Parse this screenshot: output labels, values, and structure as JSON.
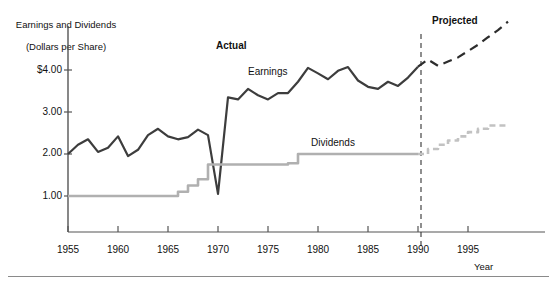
{
  "chart_data": {
    "type": "line",
    "title": "",
    "ylabel": "Earnings and Dividends\n(Dollars per Share)",
    "ylabel_line1": "Earnings and Dividends",
    "ylabel_line2": "(Dollars per Share)",
    "xlabel": "Year",
    "grid": false,
    "legend_position": "inline-annotations",
    "xlim": [
      1955,
      1999
    ],
    "ylim": [
      0.0,
      5.4
    ],
    "yticks": [
      1.0,
      2.0,
      3.0,
      4.0
    ],
    "ytick_labels": [
      "1.00",
      "2.00",
      "3.00",
      "$4.00"
    ],
    "xticks": [
      1955,
      1960,
      1965,
      1970,
      1975,
      1980,
      1985,
      1990,
      1995
    ],
    "xtick_labels": [
      "1955",
      "1960",
      "1965",
      "1970",
      "1975",
      "1980",
      "1985",
      "1990",
      "1995"
    ],
    "annotations": [
      {
        "text": "Actual",
        "x": 1973,
        "y": 4.75,
        "bold": true
      },
      {
        "text": "Projected",
        "x": 1992,
        "y": 5.25,
        "bold": true
      },
      {
        "text": "Earnings",
        "x": 1980,
        "y": 4.18,
        "bold": false
      },
      {
        "text": "Dividends",
        "x": 1986,
        "y": 2.45,
        "bold": false
      }
    ],
    "divider": {
      "x": 1990.3,
      "style": "dashed",
      "label": "actual-projected-divider"
    },
    "series": [
      {
        "name": "Earnings",
        "color": "#3d3d3d",
        "style": "solid",
        "segment": "actual",
        "x": [
          1955,
          1956,
          1957,
          1958,
          1959,
          1960,
          1961,
          1962,
          1963,
          1964,
          1965,
          1966,
          1967,
          1968,
          1969,
          1970,
          1971,
          1972,
          1973,
          1974,
          1975,
          1976,
          1977,
          1978,
          1979,
          1980,
          1981,
          1982,
          1983,
          1984,
          1985,
          1986,
          1987,
          1988,
          1989,
          1990
        ],
        "values": [
          2.0,
          2.22,
          2.35,
          2.05,
          2.15,
          2.42,
          1.95,
          2.1,
          2.45,
          2.6,
          2.42,
          2.35,
          2.4,
          2.58,
          2.45,
          1.05,
          3.35,
          3.3,
          3.55,
          3.4,
          3.3,
          3.45,
          3.45,
          3.72,
          4.05,
          3.92,
          3.78,
          3.98,
          4.07,
          3.75,
          3.6,
          3.55,
          3.72,
          3.62,
          3.82,
          4.08
        ]
      },
      {
        "name": "Earnings (projected)",
        "color": "#2d2d2d",
        "style": "dashed",
        "segment": "projected",
        "x": [
          1990,
          1991,
          1992,
          1993,
          1994,
          1995,
          1996,
          1997,
          1998,
          1999
        ],
        "values": [
          4.08,
          4.25,
          4.1,
          4.2,
          4.3,
          4.45,
          4.6,
          4.78,
          4.95,
          5.15
        ]
      },
      {
        "name": "Dividends",
        "color": "#b0b0b0",
        "style": "solid-step",
        "segment": "actual",
        "x": [
          1955,
          1966,
          1966,
          1967,
          1967,
          1968,
          1968,
          1969,
          1969,
          1977,
          1977,
          1978,
          1978,
          1990
        ],
        "values": [
          1.0,
          1.0,
          1.1,
          1.1,
          1.25,
          1.25,
          1.4,
          1.4,
          1.75,
          1.75,
          1.78,
          1.78,
          2.0,
          2.0
        ]
      },
      {
        "name": "Dividends (projected)",
        "color": "#c2c2c2",
        "style": "dashed-step",
        "segment": "projected",
        "x": [
          1990,
          1991,
          1991,
          1992,
          1992,
          1993,
          1993,
          1994,
          1994,
          1995,
          1995,
          1996,
          1996,
          1997,
          1997,
          1999
        ],
        "values": [
          2.0,
          2.0,
          2.12,
          2.12,
          2.22,
          2.22,
          2.32,
          2.32,
          2.42,
          2.42,
          2.52,
          2.52,
          2.6,
          2.6,
          2.68,
          2.68
        ]
      }
    ]
  },
  "axes": {
    "y_title_line1": "Earnings and Dividends",
    "y_title_line2": "(Dollars per Share)",
    "x_title": "Year"
  },
  "labels": {
    "actual": "Actual",
    "projected": "Projected",
    "earnings": "Earnings",
    "dividends": "Dividends"
  },
  "ticks": {
    "y": [
      "$4.00",
      "3.00",
      "2.00",
      "1.00"
    ],
    "x": [
      "1955",
      "1960",
      "1965",
      "1970",
      "1975",
      "1980",
      "1985",
      "1990",
      "1995"
    ]
  },
  "colors": {
    "earnings": "#3d3d3d",
    "earnings_projected": "#2d2d2d",
    "dividends": "#b0b0b0",
    "dividends_projected": "#c2c2c2",
    "axis": "#555555",
    "divider": "#333333",
    "rule": "#8a8a8a"
  }
}
